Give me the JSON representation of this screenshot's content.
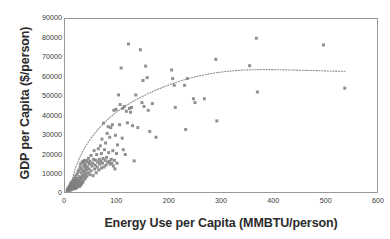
{
  "chart_data": {
    "type": "scatter",
    "title": "",
    "xlabel": "Energy Use per Capita (MMBTU/person)",
    "ylabel": "GDP per Capita ($/person)",
    "xlim": [
      0,
      600
    ],
    "ylim": [
      0,
      90000
    ],
    "xticks": [
      0,
      100,
      200,
      300,
      400,
      500,
      600
    ],
    "yticks": [
      0,
      10000,
      20000,
      30000,
      40000,
      50000,
      60000,
      70000,
      80000,
      90000
    ],
    "xtick_labels": [
      "0",
      "100",
      "200",
      "300",
      "400",
      "500",
      "600"
    ],
    "ytick_labels": [
      "0",
      "10000",
      "20000",
      "30000",
      "40000",
      "50000",
      "60000",
      "70000",
      "80000",
      "90000"
    ],
    "grid": false,
    "legend": false,
    "marker_color": "#7f7f7f",
    "marker_shape": "square",
    "marker_size": 3,
    "frame_color": "#9a9a9a",
    "background_color": "#ffffff",
    "series": [
      {
        "name": "Countries",
        "points": [
          [
            4,
            600
          ],
          [
            5,
            900
          ],
          [
            5,
            1500
          ],
          [
            6,
            700
          ],
          [
            6,
            1800
          ],
          [
            7,
            1100
          ],
          [
            7,
            2200
          ],
          [
            8,
            800
          ],
          [
            8,
            2600
          ],
          [
            9,
            1400
          ],
          [
            9,
            3100
          ],
          [
            10,
            1000
          ],
          [
            10,
            2000
          ],
          [
            10,
            3600
          ],
          [
            11,
            1600
          ],
          [
            11,
            4200
          ],
          [
            12,
            1200
          ],
          [
            12,
            2800
          ],
          [
            12,
            5000
          ],
          [
            13,
            1900
          ],
          [
            13,
            3400
          ],
          [
            14,
            2300
          ],
          [
            14,
            4600
          ],
          [
            15,
            1500
          ],
          [
            15,
            3000
          ],
          [
            15,
            5400
          ],
          [
            16,
            2600
          ],
          [
            16,
            6200
          ],
          [
            17,
            2000
          ],
          [
            17,
            4000
          ],
          [
            18,
            3200
          ],
          [
            18,
            7000
          ],
          [
            19,
            2400
          ],
          [
            19,
            5600
          ],
          [
            20,
            1800
          ],
          [
            20,
            4400
          ],
          [
            20,
            8200
          ],
          [
            21,
            3000
          ],
          [
            21,
            6400
          ],
          [
            22,
            2200
          ],
          [
            22,
            5000
          ],
          [
            23,
            3800
          ],
          [
            23,
            9200
          ],
          [
            24,
            2700
          ],
          [
            24,
            7200
          ],
          [
            25,
            4200
          ],
          [
            25,
            10500
          ],
          [
            26,
            3400
          ],
          [
            26,
            6000
          ],
          [
            27,
            5200
          ],
          [
            27,
            11500
          ],
          [
            28,
            2900
          ],
          [
            28,
            8000
          ],
          [
            29,
            4600
          ],
          [
            29,
            13000
          ],
          [
            30,
            3600
          ],
          [
            30,
            6800
          ],
          [
            30,
            14500
          ],
          [
            31,
            5600
          ],
          [
            31,
            10000
          ],
          [
            32,
            4200
          ],
          [
            32,
            12000
          ],
          [
            33,
            7600
          ],
          [
            33,
            15500
          ],
          [
            34,
            5000
          ],
          [
            34,
            9000
          ],
          [
            35,
            11000
          ],
          [
            35,
            16000
          ],
          [
            36,
            6200
          ],
          [
            36,
            13500
          ],
          [
            37,
            8400
          ],
          [
            37,
            15000
          ],
          [
            38,
            10500
          ],
          [
            38,
            16500
          ],
          [
            39,
            7000
          ],
          [
            39,
            12500
          ],
          [
            40,
            9500
          ],
          [
            40,
            14000
          ],
          [
            41,
            11500
          ],
          [
            41,
            16200
          ],
          [
            42,
            8200
          ],
          [
            43,
            13000
          ],
          [
            44,
            15500
          ],
          [
            45,
            10000
          ],
          [
            45,
            17500
          ],
          [
            46,
            12000
          ],
          [
            47,
            14500
          ],
          [
            48,
            9000
          ],
          [
            48,
            16000
          ],
          [
            50,
            11000
          ],
          [
            50,
            19000
          ],
          [
            52,
            13500
          ],
          [
            53,
            15000
          ],
          [
            54,
            8500
          ],
          [
            55,
            17000
          ],
          [
            56,
            21500
          ],
          [
            57,
            12000
          ],
          [
            58,
            14000
          ],
          [
            59,
            16500
          ],
          [
            60,
            10000
          ],
          [
            61,
            19500
          ],
          [
            62,
            13000
          ],
          [
            63,
            15500
          ],
          [
            64,
            22500
          ],
          [
            65,
            11500
          ],
          [
            66,
            17000
          ],
          [
            67,
            14500
          ],
          [
            68,
            24000
          ],
          [
            69,
            16000
          ],
          [
            70,
            12500
          ],
          [
            70,
            20000
          ],
          [
            71,
            27500
          ],
          [
            72,
            15000
          ],
          [
            73,
            17500
          ],
          [
            74,
            35800
          ],
          [
            75,
            13000
          ],
          [
            76,
            22000
          ],
          [
            77,
            16500
          ],
          [
            78,
            25500
          ],
          [
            79,
            14000
          ],
          [
            80,
            18000
          ],
          [
            81,
            30500
          ],
          [
            82,
            15500
          ],
          [
            83,
            34000
          ],
          [
            84,
            20500
          ],
          [
            85,
            16000
          ],
          [
            86,
            28500
          ],
          [
            87,
            14500
          ],
          [
            88,
            33500
          ],
          [
            89,
            17000
          ],
          [
            90,
            15000
          ],
          [
            91,
            35000
          ],
          [
            92,
            21500
          ],
          [
            93,
            13500
          ],
          [
            94,
            42500
          ],
          [
            95,
            16500
          ],
          [
            96,
            12000
          ],
          [
            97,
            29500
          ],
          [
            98,
            43000
          ],
          [
            99,
            20000
          ],
          [
            100,
            15000
          ],
          [
            101,
            24500
          ],
          [
            103,
            50500
          ],
          [
            105,
            35000
          ],
          [
            106,
            45500
          ],
          [
            108,
            64500
          ],
          [
            110,
            28000
          ],
          [
            111,
            43500
          ],
          [
            112,
            22000
          ],
          [
            114,
            44500
          ],
          [
            116,
            19500
          ],
          [
            118,
            42000
          ],
          [
            120,
            36000
          ],
          [
            122,
            77000
          ],
          [
            124,
            43500
          ],
          [
            126,
            41500
          ],
          [
            128,
            44000
          ],
          [
            130,
            34500
          ],
          [
            133,
            16200
          ],
          [
            136,
            50500
          ],
          [
            140,
            33500
          ],
          [
            145,
            74000
          ],
          [
            148,
            46500
          ],
          [
            150,
            58000
          ],
          [
            152,
            44500
          ],
          [
            155,
            65500
          ],
          [
            158,
            59500
          ],
          [
            160,
            42500
          ],
          [
            163,
            31500
          ],
          [
            168,
            46000
          ],
          [
            175,
            28500
          ],
          [
            205,
            63500
          ],
          [
            207,
            59000
          ],
          [
            210,
            55500
          ],
          [
            212,
            44000
          ],
          [
            230,
            55500
          ],
          [
            232,
            32500
          ],
          [
            235,
            59000
          ],
          [
            247,
            48500
          ],
          [
            250,
            46500
          ],
          [
            268,
            48500
          ],
          [
            290,
            69000
          ],
          [
            292,
            37000
          ],
          [
            355,
            65700
          ],
          [
            368,
            80000
          ],
          [
            370,
            52000
          ],
          [
            497,
            76500
          ],
          [
            538,
            54000
          ]
        ]
      }
    ],
    "trendline": {
      "style": "dotted",
      "color": "#8a8a8a",
      "description": "Logarithmic / saturating fit",
      "points": [
        [
          12,
          4500
        ],
        [
          20,
          12500
        ],
        [
          30,
          19000
        ],
        [
          40,
          24000
        ],
        [
          50,
          28000
        ],
        [
          60,
          31500
        ],
        [
          70,
          34500
        ],
        [
          80,
          37200
        ],
        [
          90,
          39600
        ],
        [
          100,
          41800
        ],
        [
          115,
          44600
        ],
        [
          130,
          47000
        ],
        [
          145,
          49200
        ],
        [
          160,
          51200
        ],
        [
          175,
          53000
        ],
        [
          190,
          54700
        ],
        [
          205,
          56200
        ],
        [
          220,
          57600
        ],
        [
          235,
          58800
        ],
        [
          250,
          59900
        ],
        [
          265,
          60800
        ],
        [
          280,
          61600
        ],
        [
          295,
          62200
        ],
        [
          310,
          62700
        ],
        [
          325,
          63100
        ],
        [
          340,
          63400
        ],
        [
          360,
          63600
        ],
        [
          380,
          63700
        ],
        [
          400,
          63650
        ],
        [
          430,
          63500
        ],
        [
          460,
          63300
        ],
        [
          490,
          63100
        ],
        [
          515,
          62900
        ],
        [
          540,
          62800
        ]
      ]
    }
  }
}
